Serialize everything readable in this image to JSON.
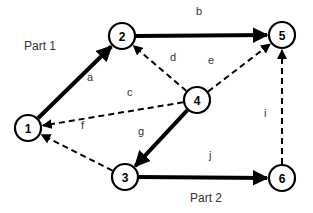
{
  "diagram": {
    "parts": [
      {
        "id": "part1",
        "label": "Part 1",
        "x": 24,
        "y": 40
      },
      {
        "id": "part2",
        "label": "Part 2",
        "x": 190,
        "y": 192
      }
    ],
    "nodes": [
      {
        "id": "1",
        "label": "1",
        "x": 28,
        "y": 128
      },
      {
        "id": "2",
        "label": "2",
        "x": 122,
        "y": 36
      },
      {
        "id": "3",
        "label": "3",
        "x": 125,
        "y": 177
      },
      {
        "id": "4",
        "label": "4",
        "x": 197,
        "y": 100
      },
      {
        "id": "5",
        "label": "5",
        "x": 282,
        "y": 35
      },
      {
        "id": "6",
        "label": "6",
        "x": 282,
        "y": 178
      }
    ],
    "edges": [
      {
        "id": "a",
        "label": "a",
        "from": "1",
        "to": "2",
        "style": "solid",
        "lx": 87,
        "ly": 72
      },
      {
        "id": "b",
        "label": "b",
        "from": "2",
        "to": "5",
        "style": "solid",
        "lx": 196,
        "ly": 6
      },
      {
        "id": "c",
        "label": "c",
        "from": "4",
        "to": "1",
        "style": "dashed",
        "lx": 127,
        "ly": 87
      },
      {
        "id": "d",
        "label": "d",
        "from": "4",
        "to": "2",
        "style": "dashed",
        "lx": 170,
        "ly": 52
      },
      {
        "id": "e",
        "label": "e",
        "from": "4",
        "to": "5",
        "style": "dashed",
        "lx": 208,
        "ly": 55
      },
      {
        "id": "f",
        "label": "f",
        "from": "3",
        "to": "1",
        "style": "dashed",
        "lx": 81,
        "ly": 120
      },
      {
        "id": "g",
        "label": "g",
        "from": "4",
        "to": "3",
        "style": "solid",
        "lx": 138,
        "ly": 126
      },
      {
        "id": "i",
        "label": "i",
        "from": "6",
        "to": "5",
        "style": "dashed",
        "lx": 264,
        "ly": 108
      },
      {
        "id": "j",
        "label": "j",
        "from": "3",
        "to": "6",
        "style": "solid",
        "lx": 209,
        "ly": 150
      }
    ]
  }
}
